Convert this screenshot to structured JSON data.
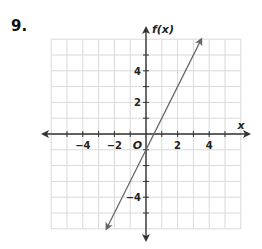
{
  "problem": {
    "number": "9."
  },
  "chart_data": {
    "type": "line",
    "title": "",
    "xlabel": "x",
    "ylabel": "f(x)",
    "origin_label": "O",
    "xlim": [
      -6,
      6
    ],
    "ylim": [
      -6,
      6
    ],
    "grid": true,
    "x_tick_labels": [
      "−4",
      "−2",
      "2",
      "4"
    ],
    "x_tick_values": [
      -4,
      -2,
      2,
      4
    ],
    "y_tick_labels": [
      "4",
      "2",
      "−4"
    ],
    "y_tick_values": [
      4,
      2,
      -4
    ],
    "series": [
      {
        "name": "f(x) = 2x − 1",
        "slope": 2,
        "intercept": -1,
        "x": [
          -2.5,
          3.5
        ],
        "y": [
          -6,
          6
        ],
        "arrows_both_ends": true
      }
    ]
  },
  "colors": {
    "grid": "#d9d9d9",
    "axis": "#333333",
    "line": "#666666",
    "text": "#222222"
  }
}
